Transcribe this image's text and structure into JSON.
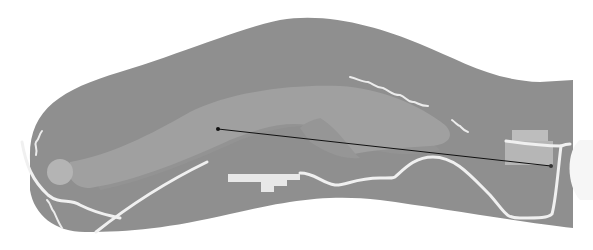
{
  "map": {
    "type": "golf-hole-layout",
    "view": "top-down",
    "colors": {
      "background": "#ffffff",
      "rough": "#8f8f8f",
      "fairway": "#a0a0a0",
      "fairway_shadow": "#929292",
      "green": "#b4b4b4",
      "cart_path": "#f0f0f0",
      "tee_box": "#bdbdbd",
      "building": "#e8e8e8",
      "distance_line": "#111111",
      "hazard_line": "#ececec"
    },
    "features": {
      "green": {
        "cx": 60,
        "cy": 172,
        "r": 13
      },
      "distance_line": {
        "start": {
          "x": 218,
          "y": 129
        },
        "end": {
          "x": 551,
          "y": 166
        }
      },
      "tee_boxes": [
        {
          "x": 512,
          "y": 130,
          "w": 36,
          "h": 14
        },
        {
          "x": 505,
          "y": 141,
          "w": 48,
          "h": 24
        }
      ],
      "building": "clubhouse-structure"
    }
  }
}
